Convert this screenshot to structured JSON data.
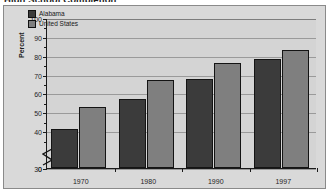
{
  "figure": {
    "title": "High School Completion",
    "background_color": "#d9d9d9",
    "plot_background_color": "#d4d4d4",
    "frame_color": "#8a8a8a"
  },
  "legend": {
    "position": "top-left-inside",
    "entries": [
      {
        "label": "Alabama",
        "color": "#3b3b3b"
      },
      {
        "label": "United States",
        "color": "#7f7f7f"
      }
    ]
  },
  "axis": {
    "y_title": "Percent",
    "y_ticks": [
      "0",
      "30",
      "40",
      "50",
      "60",
      "70",
      "80",
      "90",
      "100"
    ],
    "y_break": true,
    "x_ticks": [
      "1970",
      "1980",
      "1990",
      "1997"
    ]
  },
  "chart_data": {
    "type": "bar",
    "title": "High School Completion",
    "xlabel": "",
    "ylabel": "Percent",
    "categories": [
      "1970",
      "1980",
      "1990",
      "1997"
    ],
    "series": [
      {
        "name": "Alabama",
        "color": "#3b3b3b",
        "values": [
          41,
          57,
          67.5,
          78.5
        ]
      },
      {
        "name": "United States",
        "color": "#7f7f7f",
        "values": [
          53,
          67,
          76,
          83
        ]
      }
    ],
    "ylim": [
      0,
      100
    ],
    "ytick_values": [
      0,
      30,
      40,
      50,
      60,
      70,
      80,
      90,
      100
    ],
    "y_axis_break": {
      "from": 0,
      "to": 30
    },
    "grid": true,
    "legend_position": "upper left"
  }
}
